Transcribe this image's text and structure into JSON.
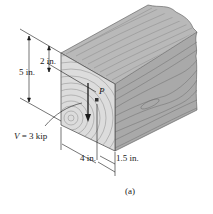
{
  "figure": {
    "caption": "(a)",
    "object": "wooden beam (rectangular cross-section)",
    "colors": {
      "wood_top": "#b9b9b9",
      "wood_front": "#dcdcdc",
      "wood_side": "#a9a9a9",
      "grain": "#7a7a7a",
      "ink": "#1a1a1a"
    }
  },
  "dimensions": {
    "height_total": "5 in.",
    "height_to_point": "2 in.",
    "width": "4 in.",
    "offset": "1.5 in."
  },
  "load": {
    "label_var": "V",
    "label_rest": " = 3 kip",
    "point_label": "P"
  }
}
